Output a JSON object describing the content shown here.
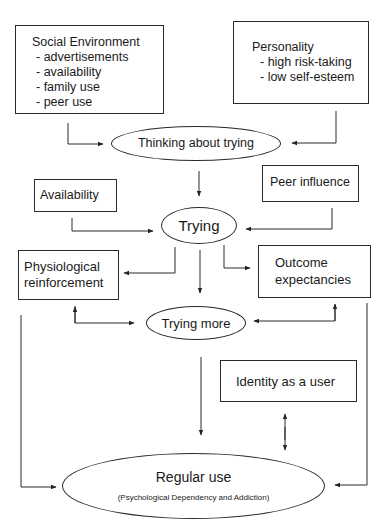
{
  "diagram": {
    "nodes": {
      "social_environment": {
        "title": "Social Environment",
        "items": [
          "- advertisements",
          "- availability",
          "- family use",
          "- peer use"
        ]
      },
      "personality": {
        "title": "Personality",
        "items": [
          "- high risk-taking",
          "- low self-esteem"
        ]
      },
      "thinking_about_trying": {
        "label": "Thinking about trying"
      },
      "availability": {
        "label": "Availability"
      },
      "peer_influence": {
        "label": "Peer influence"
      },
      "trying": {
        "label": "Trying"
      },
      "physiological_reinforcement": {
        "line1": "Physiological",
        "line2": "reinforcement"
      },
      "outcome_expectancies": {
        "line1": "Outcome",
        "line2": "expectancies"
      },
      "trying_more": {
        "label": "Trying more"
      },
      "identity_as_user": {
        "label": "Identity as a user"
      },
      "regular_use": {
        "label": "Regular use",
        "sublabel": "(Psychological Dependency and Addiction)"
      }
    },
    "edges": [
      {
        "from": "Social Environment",
        "to": "Thinking about trying"
      },
      {
        "from": "Personality",
        "to": "Thinking about trying"
      },
      {
        "from": "Thinking about trying",
        "to": "Trying"
      },
      {
        "from": "Availability",
        "to": "Trying"
      },
      {
        "from": "Peer influence",
        "to": "Trying"
      },
      {
        "from": "Trying",
        "to": "Physiological reinforcement"
      },
      {
        "from": "Trying",
        "to": "Outcome expectancies"
      },
      {
        "from": "Trying",
        "to": "Trying more"
      },
      {
        "from": "Physiological reinforcement",
        "to": "Trying more",
        "bidirectional": true
      },
      {
        "from": "Outcome expectancies",
        "to": "Trying more",
        "bidirectional": true
      },
      {
        "from": "Trying more",
        "to": "Regular use"
      },
      {
        "from": "Identity as a user",
        "to": "Regular use",
        "bidirectional": true
      },
      {
        "from": "Physiological reinforcement",
        "to": "Regular use"
      },
      {
        "from": "Outcome expectancies",
        "to": "Regular use"
      }
    ]
  }
}
